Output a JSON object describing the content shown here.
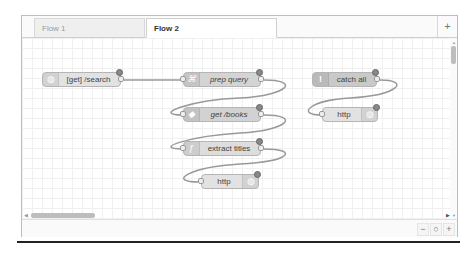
{
  "tabs": [
    {
      "label": "Flow 1",
      "active": false
    },
    {
      "label": "Flow 2",
      "active": true
    }
  ],
  "add_tab_icon": "+",
  "nodes": [
    {
      "id": "n1",
      "label": "[get] /search",
      "type": "http in",
      "color": "#e7e7ae",
      "italic": false
    },
    {
      "id": "n2",
      "label": "prep query",
      "type": "template",
      "color": "#d8bfd8",
      "italic": true
    },
    {
      "id": "n3",
      "label": "get /books",
      "type": "mongodb",
      "color": "#aaaa66",
      "italic": true
    },
    {
      "id": "n4",
      "label": "extract titles",
      "type": "function",
      "color": "#fdd0a2",
      "italic": false
    },
    {
      "id": "n5",
      "label": "http",
      "type": "http response",
      "color": "#e7e7ae",
      "italic": false
    },
    {
      "id": "n6",
      "label": "catch all",
      "type": "catch",
      "color": "#e49191",
      "italic": false
    },
    {
      "id": "n7",
      "label": "http",
      "type": "http response",
      "color": "#e7e7ae",
      "italic": false
    }
  ],
  "zoom_controls": {
    "zoom_out": "−",
    "reset": "○",
    "zoom_in": "+"
  },
  "icons": {
    "add_tab": "plus-icon",
    "exclamation": "!",
    "function": "ƒ"
  }
}
